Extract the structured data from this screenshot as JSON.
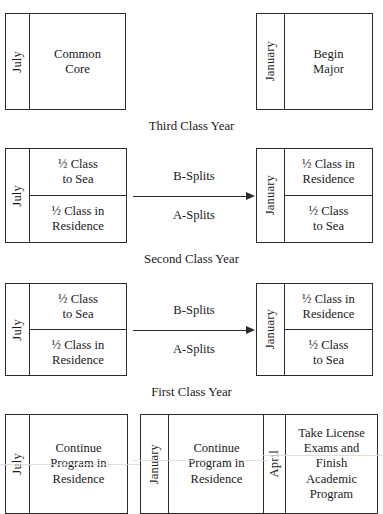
{
  "diagram": {
    "rows": [
      {
        "id": "third-class-year",
        "caption": "Third Class Year",
        "left_box": {
          "month": "July",
          "cells": [
            "Common\nCore"
          ]
        },
        "right_box": {
          "month": "January",
          "cells": [
            "Begin\nMajor"
          ]
        },
        "arrow": null
      },
      {
        "id": "second-class-year",
        "caption": "Second Class Year",
        "left_box": {
          "month": "July",
          "cells": [
            "½ Class\nto Sea",
            "½ Class in\nResidence"
          ]
        },
        "right_box": {
          "month": "January",
          "cells": [
            "½ Class in\nResidence",
            "½ Class\nto Sea"
          ]
        },
        "arrow": {
          "label_above": "B-Splits",
          "label_below": "A-Splits",
          "direction": "right"
        }
      },
      {
        "id": "first-class-year",
        "caption": "First Class Year",
        "left_box": {
          "month": "July",
          "cells": [
            "½ Class\nto Sea",
            "½ Class in\nResidence"
          ]
        },
        "right_box": {
          "month": "January",
          "cells": [
            "½ Class in\nResidence",
            "½ Class\nto Sea"
          ]
        },
        "arrow": {
          "label_above": "B-Splits",
          "label_below": "A-Splits",
          "direction": "right"
        }
      },
      {
        "id": "final-row",
        "caption": "",
        "boxes": [
          {
            "month": "July",
            "cells": [
              "Continue\nProgram in\nResidence"
            ]
          },
          {
            "month": "January",
            "cells": [
              "Continue\nProgram in\nResidence"
            ]
          },
          {
            "month": "April",
            "cells": [
              "Take License\nExams and\nFinish\nAcademic\nProgram"
            ]
          }
        ]
      }
    ],
    "colors": {
      "stroke": "#2b2b2b",
      "background": "#ffffff",
      "text": "#1a1a1a"
    }
  }
}
